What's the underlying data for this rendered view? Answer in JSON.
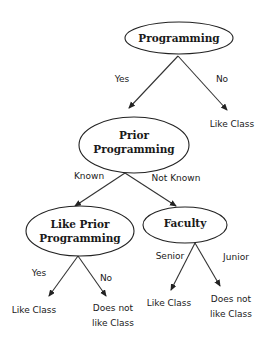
{
  "diagram": {
    "type": "decision-tree",
    "nodes": {
      "root": {
        "lines": [
          "Programming"
        ]
      },
      "prior": {
        "lines": [
          "Prior",
          "Programming"
        ]
      },
      "like_prior": {
        "lines": [
          "Like Prior",
          "Programming"
        ]
      },
      "faculty": {
        "lines": [
          "Faculty"
        ]
      }
    },
    "edges": {
      "root_yes": "Yes",
      "root_no": "No",
      "prior_known": "Known",
      "prior_not_known": "Not Known",
      "like_prior_yes": "Yes",
      "like_prior_no": "No",
      "faculty_senior": "Senior",
      "faculty_junior": "Junior"
    },
    "leaves": {
      "root_no_leaf": {
        "lines": [
          "Like Class"
        ]
      },
      "like_prior_yes_leaf": {
        "lines": [
          "Like Class"
        ]
      },
      "like_prior_no_leaf": {
        "lines": [
          "Does not",
          "like Class"
        ]
      },
      "faculty_senior_leaf": {
        "lines": [
          "Like Class"
        ]
      },
      "faculty_junior_leaf": {
        "lines": [
          "Does not",
          "like Class"
        ]
      }
    }
  }
}
